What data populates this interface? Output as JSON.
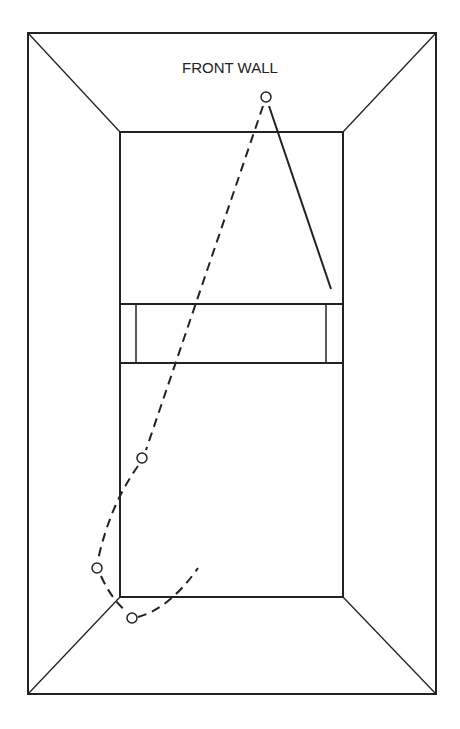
{
  "diagram": {
    "label": "FRONT WALL",
    "stroke_color": "#222222",
    "balls": [
      {
        "name": "front-wall-contact",
        "x": 266,
        "y": 97
      },
      {
        "name": "side-wall-bounce",
        "x": 142,
        "y": 458
      },
      {
        "name": "back-left-ball",
        "x": 97,
        "y": 568
      },
      {
        "name": "back-corner-ball",
        "x": 132,
        "y": 618
      }
    ]
  }
}
